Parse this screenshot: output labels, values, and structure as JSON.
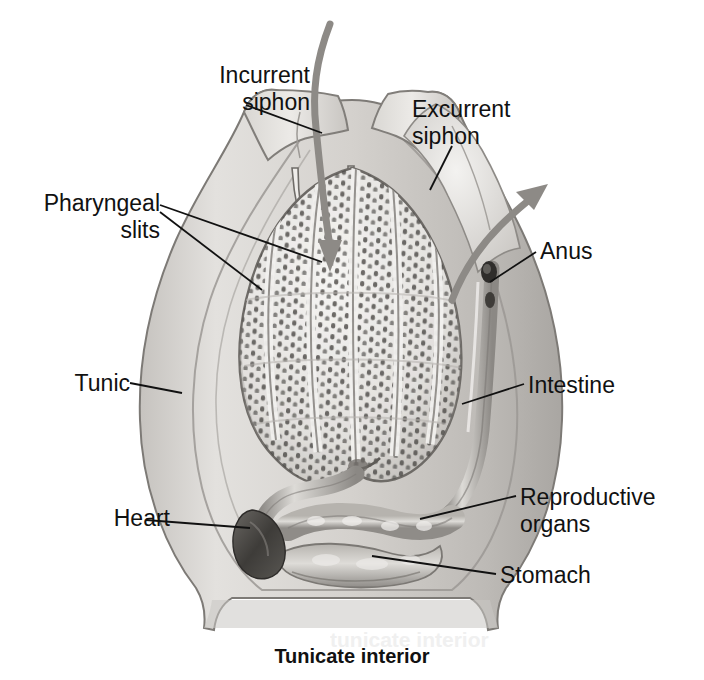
{
  "figure": {
    "caption": "Tunicate interior",
    "ghost_text": "tunicate interior",
    "background": "#ffffff",
    "ink": "#111111"
  },
  "palette": {
    "tunic_outer": "#cfcdc9",
    "tunic_mid": "#bdbab5",
    "tunic_inner": "#d8d6d2",
    "pharynx_light": "#efeeec",
    "pharynx_ridge": "#a9a6a1",
    "slit_dark": "#4a4a4a",
    "organ_gray": "#9b9893",
    "heart_dark": "#4e4b48",
    "arrow_gray": "#8d8a86",
    "leader_line": "#111111"
  },
  "labels": [
    {
      "id": "incurrent-siphon",
      "text": "Incurrent\nsiphon",
      "align": "right",
      "x": 120,
      "y": 62,
      "width": 190
    },
    {
      "id": "pharyngeal-slits",
      "text": "Pharyngeal\nslits",
      "align": "right",
      "x": 8,
      "y": 190,
      "width": 152
    },
    {
      "id": "tunic",
      "text": "Tunic",
      "align": "right",
      "x": 20,
      "y": 370,
      "width": 110
    },
    {
      "id": "heart",
      "text": "Heart",
      "align": "right",
      "x": 60,
      "y": 505,
      "width": 110
    },
    {
      "id": "excurrent-siphon",
      "text": "Excurrent\nsiphon",
      "align": "left",
      "x": 412,
      "y": 96,
      "width": 180
    },
    {
      "id": "anus",
      "text": "Anus",
      "align": "left",
      "x": 540,
      "y": 238,
      "width": 110
    },
    {
      "id": "intestine",
      "text": "Intestine",
      "align": "left",
      "x": 528,
      "y": 372,
      "width": 150
    },
    {
      "id": "reproductive-organs",
      "text": "Reproductive\norgans",
      "align": "left",
      "x": 520,
      "y": 484,
      "width": 180
    },
    {
      "id": "stomach",
      "text": "Stomach",
      "align": "left",
      "x": 500,
      "y": 562,
      "width": 160
    }
  ],
  "structures": [
    {
      "id": "tunic",
      "label": "Tunic",
      "description": "translucent outer body wall"
    },
    {
      "id": "incurrent-siphon",
      "label": "Incurrent siphon",
      "description": "water inflow opening at top left"
    },
    {
      "id": "excurrent-siphon",
      "label": "Excurrent siphon",
      "description": "water outflow opening at upper right"
    },
    {
      "id": "pharyngeal-basket",
      "label": "Pharyngeal slits",
      "description": "perforated pharynx filling the upper body"
    },
    {
      "id": "anus",
      "label": "Anus",
      "description": "opening into the atrial cavity near the excurrent siphon"
    },
    {
      "id": "intestine",
      "label": "Intestine",
      "description": "tube running up the right side"
    },
    {
      "id": "reproductive-organs",
      "label": "Reproductive organs",
      "description": "gonad coiled below the pharynx"
    },
    {
      "id": "stomach",
      "label": "Stomach",
      "description": "enlarged sac at the base of the gut loop"
    },
    {
      "id": "heart",
      "label": "Heart",
      "description": "dark organ at the lower left of the visceral mass"
    }
  ],
  "flow_arrows": [
    {
      "id": "inflow-arrow",
      "label": "water in",
      "direction": "down into incurrent siphon"
    },
    {
      "id": "outflow-arrow",
      "label": "water out",
      "direction": "up and out of excurrent siphon"
    }
  ]
}
